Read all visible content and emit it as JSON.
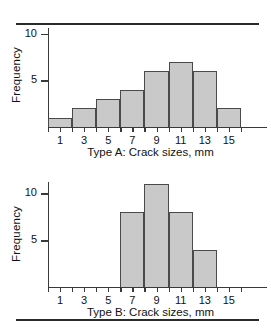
{
  "page": {
    "top_rule": "horizontal-rule",
    "bottom_rule": "horizontal-rule"
  },
  "charts": [
    {
      "id": "type-a",
      "caption": "Type A: Crack sizes, mm",
      "ylabel": "Frequency",
      "yticks": [
        5,
        10
      ],
      "ytick_labels": [
        "5",
        "10"
      ],
      "xtick_labels": [
        "1",
        "3",
        "5",
        "7",
        "9",
        "11",
        "13",
        "15"
      ]
    },
    {
      "id": "type-b",
      "caption": "Type B: Crack sizes, mm",
      "ylabel": "Frequency",
      "yticks": [
        5,
        10
      ],
      "ytick_labels": [
        "5",
        "10"
      ],
      "xtick_labels": [
        "1",
        "3",
        "5",
        "7",
        "9",
        "11",
        "13",
        "15"
      ]
    }
  ],
  "chart_data": [
    {
      "type": "bar",
      "title": "Type A: Crack sizes, mm",
      "subtitle": "",
      "xlabel": "Type A: Crack sizes, mm",
      "ylabel": "Frequency",
      "orientation": "vertical",
      "grid": false,
      "legend": null,
      "bin_width": 2,
      "bin_edges": [
        0,
        2,
        4,
        6,
        8,
        10,
        12,
        14,
        16
      ],
      "categories": [
        "0-2",
        "2-4",
        "4-6",
        "6-8",
        "8-10",
        "10-12",
        "12-14",
        "14-16"
      ],
      "bin_midpoints": [
        1,
        3,
        5,
        7,
        9,
        11,
        13,
        15
      ],
      "values": [
        1,
        2,
        3,
        4,
        6,
        7,
        6,
        2
      ],
      "xlim": [
        0,
        17
      ],
      "ylim": [
        0,
        11
      ],
      "xticks": [
        1,
        3,
        5,
        7,
        9,
        11,
        13,
        15
      ],
      "xtick_labels": [
        "1",
        "3",
        "5",
        "7",
        "9",
        "11",
        "13",
        "15"
      ],
      "yticks": [
        5,
        10
      ],
      "ytick_labels": [
        "5",
        "10"
      ],
      "bar_fill": "#c9c9c9",
      "bar_edge": "#4a4a4a"
    },
    {
      "type": "bar",
      "title": "Type B: Crack sizes, mm",
      "subtitle": "",
      "xlabel": "Type B: Crack sizes, mm",
      "ylabel": "Frequency",
      "orientation": "vertical",
      "grid": false,
      "legend": null,
      "bin_width": 2,
      "bin_edges": [
        0,
        2,
        4,
        6,
        8,
        10,
        12,
        14,
        16
      ],
      "categories": [
        "0-2",
        "2-4",
        "4-6",
        "6-8",
        "8-10",
        "10-12",
        "12-14",
        "14-16"
      ],
      "bin_midpoints": [
        1,
        3,
        5,
        7,
        9,
        11,
        13,
        15
      ],
      "values": [
        0,
        0,
        0,
        8,
        11,
        8,
        4,
        0
      ],
      "xlim": [
        0,
        17
      ],
      "ylim": [
        0,
        12
      ],
      "xticks": [
        1,
        3,
        5,
        7,
        9,
        11,
        13,
        15
      ],
      "xtick_labels": [
        "1",
        "3",
        "5",
        "7",
        "9",
        "11",
        "13",
        "15"
      ],
      "yticks": [
        5,
        10
      ],
      "ytick_labels": [
        "5",
        "10"
      ],
      "bar_fill": "#c9c9c9",
      "bar_edge": "#4a4a4a"
    }
  ]
}
